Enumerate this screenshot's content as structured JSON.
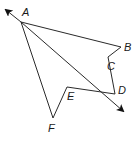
{
  "diagram": {
    "points": {
      "A": {
        "label": "A",
        "x": 21,
        "y": 22,
        "lx": 22,
        "ly": 16
      },
      "B": {
        "label": "B",
        "x": 121,
        "y": 47,
        "lx": 124,
        "ly": 51
      },
      "C": {
        "label": "C",
        "x": 108,
        "y": 57,
        "lx": 107,
        "ly": 70
      },
      "D": {
        "label": "D",
        "x": 115,
        "y": 94,
        "lx": 118,
        "ly": 94
      },
      "E": {
        "label": "E",
        "x": 67,
        "y": 87,
        "lx": 67,
        "ly": 100
      },
      "F": {
        "label": "F",
        "x": 53,
        "y": 118,
        "lx": 48,
        "ly": 132
      }
    },
    "segments": [
      [
        "A",
        "B"
      ],
      [
        "B",
        "C"
      ],
      [
        "C",
        "D"
      ],
      [
        "A",
        "F"
      ],
      [
        "F",
        "E"
      ],
      [
        "E",
        "D"
      ]
    ],
    "line": {
      "through": [
        "A",
        "D"
      ],
      "arrow_start": {
        "x": 5,
        "y": 9
      },
      "arrow_end": {
        "x": 124,
        "y": 112
      }
    }
  }
}
